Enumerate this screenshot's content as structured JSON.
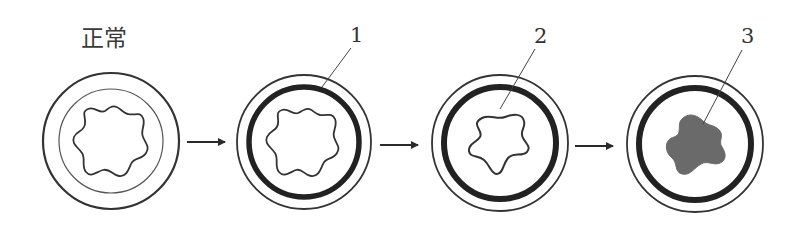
{
  "diagram": {
    "title_label": "正常",
    "stages": [
      {
        "id": "normal",
        "label": "正常",
        "has_thick_ring": false,
        "lumen": "wavy-outline"
      },
      {
        "id": "stage-1",
        "label": "1",
        "has_thick_ring": true,
        "lumen": "wavy-outline"
      },
      {
        "id": "stage-2",
        "label": "2",
        "has_thick_ring": true,
        "lumen": "small-outline"
      },
      {
        "id": "stage-3",
        "label": "3",
        "has_thick_ring": true,
        "lumen": "filled"
      }
    ],
    "callouts": {
      "one": "1",
      "two": "2",
      "three": "3"
    },
    "arrows_count": 3,
    "colors": {
      "stroke": "#2a2a2a",
      "thin": "#555555",
      "fill": "#6a6a6a",
      "background": "#ffffff"
    }
  }
}
